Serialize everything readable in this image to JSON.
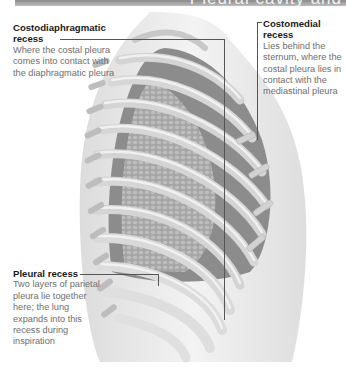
{
  "header": {
    "title": "Pleural cavity and"
  },
  "illustration": {
    "subject": "thoracic-ribcage-lateral-view",
    "colors": {
      "body_silhouette": "#e9e9e9",
      "rib": "#cfcfcf",
      "rib_highlight": "#f0f0f0",
      "lung": "#8f8f8f",
      "lung_texture": "#b3b3b3",
      "leader_line": "#555555",
      "header_bar": "#9a9a9a"
    }
  },
  "labels": {
    "costodiaphragmatic": {
      "title": "Costodiaphragmatic recess",
      "description": "Where the costal pleura comes into contact with the diaphragmatic pleura"
    },
    "costomedial": {
      "title": "Costomedial recess",
      "description": "Lies behind the sternum, where the costal pleura lies in contact with the mediastinal pleura"
    },
    "pleural_recess": {
      "title": "Pleural recess",
      "description": "Two layers of parietal pleura lie together here; the lung expands into this recess during inspiration"
    }
  }
}
